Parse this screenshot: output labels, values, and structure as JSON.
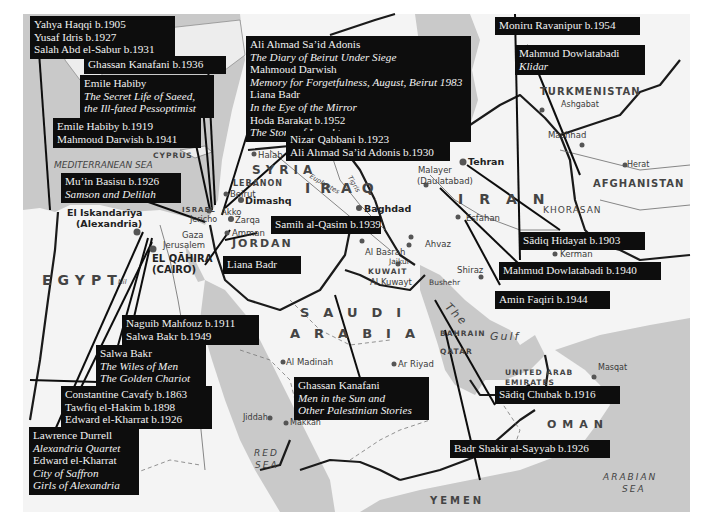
{
  "map": {
    "title": "Literary map of the Middle East",
    "colors": {
      "sea": "#c9c9c9",
      "land": "#f4f4f4",
      "border": "#1a1a1a",
      "label_bg": "#0d0d0d",
      "label_text": "#f2f2f2"
    }
  },
  "author_labels": [
    {
      "id": "haqqi-idris-sabur",
      "lines": [
        {
          "text": "Yahya Haqqi b.1905"
        },
        {
          "text": "Yusaf Idris b.1927"
        },
        {
          "text": "Salah Abd el-Sabur b.1931"
        }
      ]
    },
    {
      "id": "kanafani-1936",
      "lines": [
        {
          "text": "Ghassan Kanafani b.1936"
        }
      ]
    },
    {
      "id": "habiby-secret-life",
      "lines": [
        {
          "text": "Emile Habiby"
        },
        {
          "text": "The Secret Life of Saeed,",
          "italic": true
        },
        {
          "text": "the Ill-fated Pessoptimist",
          "italic": true
        }
      ]
    },
    {
      "id": "habiby-darwish",
      "lines": [
        {
          "text": "Emile Habiby b.1919"
        },
        {
          "text": "Mahmoud Darwish b.1941"
        }
      ]
    },
    {
      "id": "basisu",
      "lines": [
        {
          "text": "Mu’in Basisu b.1926"
        },
        {
          "text": "Samson and Delilah",
          "italic": true
        }
      ]
    },
    {
      "id": "beirut-works",
      "lines": [
        {
          "text": "Ali Ahmad Sa’id Adonis"
        },
        {
          "text": "The Diary of Beirut Under Siege",
          "italic": true
        },
        {
          "text": "Mahmoud Darwish"
        },
        {
          "text": "Memory for Forgetfulness, August, Beirut 1983",
          "italic": true
        },
        {
          "text": "Liana Badr"
        },
        {
          "text": "In the Eye of the Mirror",
          "italic": true
        },
        {
          "text": "Hoda Barakat b.1952"
        },
        {
          "text": "The Stone of Laughter",
          "italic": true
        }
      ]
    },
    {
      "id": "qabbani-adonis",
      "lines": [
        {
          "text": "Nizar Qabbani b.1923"
        },
        {
          "text": "Ali Ahmad Sa’id Adonis b.1930"
        }
      ]
    },
    {
      "id": "ravanipur",
      "lines": [
        {
          "text": "Moniru Ravanipur b.1954"
        }
      ]
    },
    {
      "id": "dowlatabadi-klidar",
      "lines": [
        {
          "text": "Mahmud Dowlatabadi"
        },
        {
          "text": "Klidar",
          "italic": true
        }
      ]
    },
    {
      "id": "samih",
      "lines": [
        {
          "text": "Samih al-Qasim b.1939"
        }
      ]
    },
    {
      "id": "liana-badr",
      "lines": [
        {
          "text": "Liana Badr"
        }
      ]
    },
    {
      "id": "hidayat",
      "lines": [
        {
          "text": "Sādiq Hidayat b.1903"
        }
      ]
    },
    {
      "id": "dowlatabadi-1940",
      "lines": [
        {
          "text": "Mahmud Dowlatabadi b.1940"
        }
      ]
    },
    {
      "id": "faqiri",
      "lines": [
        {
          "text": "Amin Faqiri b.1944"
        }
      ]
    },
    {
      "id": "mahfouz-bakr",
      "lines": [
        {
          "text": "Naguib Mahfouz b.1911"
        },
        {
          "text": "Salwa Bakr b.1949"
        }
      ]
    },
    {
      "id": "bakr-works",
      "lines": [
        {
          "text": "Salwa Bakr"
        },
        {
          "text": "The Wiles of Men",
          "italic": true
        },
        {
          "text": "The Golden Chariot",
          "italic": true
        }
      ]
    },
    {
      "id": "cavafy-hakim-kharrat",
      "lines": [
        {
          "text": "Constantine Cavafy b.1863"
        },
        {
          "text": "Tawfiq el-Hakim b.1898"
        },
        {
          "text": "Edward el-Kharrat b.1926"
        }
      ]
    },
    {
      "id": "kanafani-men-sun",
      "lines": [
        {
          "text": "Ghassan Kanafani"
        },
        {
          "text": "Men in the Sun and",
          "italic": true
        },
        {
          "text": "Other Palestinian Stories",
          "italic": true
        }
      ]
    },
    {
      "id": "chubak",
      "lines": [
        {
          "text": "Sādiq Chubak b.1916"
        }
      ]
    },
    {
      "id": "durrell-kharrat",
      "lines": [
        {
          "text": "Lawrence Durrell"
        },
        {
          "text": "Alexandria Quartet",
          "italic": true
        },
        {
          "text": "Edward el-Kharrat"
        },
        {
          "text": "City of Saffron",
          "italic": true
        },
        {
          "text": "Girls of Alexandria",
          "italic": true
        }
      ]
    },
    {
      "id": "sayyab",
      "lines": [
        {
          "text": "Badr Shakir al-Sayyab b.1926"
        }
      ]
    }
  ],
  "countries": {
    "egypt": "EGYPT",
    "syria": "SYRIA",
    "iraq": "IRAQ",
    "iran": "IRAN",
    "jordan": "JORDAN",
    "saudi_1": "SAUDI",
    "saudi_2": "ARABIA",
    "turkmenistan": "TURKMENISTAN",
    "afghanistan": "AFGHANISTAN",
    "lebanon": "LEBANON",
    "israel": "ISRAEL",
    "kuwait": "KUWAIT",
    "bahrain": "BAHRAIN",
    "qatar": "QATAR",
    "uae_1": "UNITED ARAB",
    "uae_2": "EMIRATES",
    "oman": "OMAN",
    "yemen": "YEMEN",
    "cyprus": "CYPRUS",
    "khorasan": "KHORASAN"
  },
  "seas": {
    "mediterranean": "MEDITERRANEAN SEA",
    "red_1": "RED",
    "red_2": "SEA",
    "arabian_1": "ARABIAN",
    "arabian_2": "SEA",
    "gulf_1": "The",
    "gulf_2": "Gulf"
  },
  "rivers": {
    "euphrates": "Euphrates",
    "tigris": "Tigris",
    "nil": "Nil"
  },
  "cities": {
    "alexandria_1": "El Iskandarīya",
    "alexandria_2": "(Alexandria)",
    "cairo_1": "EL QĀHIRA",
    "cairo_2": "(CAIRO)",
    "jerusalem": "Jerusalem",
    "gaza": "Gaza",
    "jericho": "Jericho",
    "akko": "Akko",
    "beirut": "Beirut",
    "dimashq": "Dimashq",
    "zarqa": "Zarqa",
    "amman": "Amman",
    "halab": "Halab",
    "baghdad": "Baghdad",
    "al_basrah": "Al Basrah",
    "jaikur": "Jaikur",
    "al_kuwayt": "Al Kuwayt",
    "ahvaz": "Ahvaz",
    "bushehr": "Bushehr",
    "shiraz": "Shiraz",
    "esfahan": "Esfahan",
    "tehran": "Tehran",
    "malayer_1": "Malayer",
    "malayer_2": "(Daulatabad)",
    "kerman": "Kerman",
    "mashhad": "Mashhad",
    "ashgabat": "Ashgabat",
    "herat": "Herat",
    "masqat": "Masqat",
    "al_madinah": "Al Madinah",
    "ar_riyad": "Ar Riyad",
    "jiddah": "Jiddah",
    "makkah": "Makkah"
  }
}
